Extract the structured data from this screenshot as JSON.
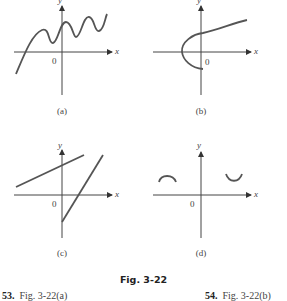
{
  "figure": {
    "title": "Fig. 3-22",
    "panels": [
      {
        "id": "a",
        "caption": "(a)",
        "x_label": "x",
        "y_label": "y",
        "origin_label": "0",
        "description": "wavy increasing curve crossing x-axis"
      },
      {
        "id": "b",
        "caption": "(b)",
        "x_label": "x",
        "y_label": "y",
        "origin_label": "0",
        "description": "sideways parabola opening right"
      },
      {
        "id": "c",
        "caption": "(c)",
        "x_label": "x",
        "y_label": "y",
        "origin_label": "0",
        "description": "two line segments, one shallow, one steep"
      },
      {
        "id": "d",
        "caption": "(d)",
        "x_label": "x",
        "y_label": "y",
        "origin_label": "0",
        "description": "two small arcs, one concave down on left, one concave up on right"
      }
    ]
  },
  "exercises": [
    {
      "number": "53.",
      "text": "Fig. 3-22(a)"
    },
    {
      "number": "54.",
      "text": "Fig. 3-22(b)"
    }
  ]
}
